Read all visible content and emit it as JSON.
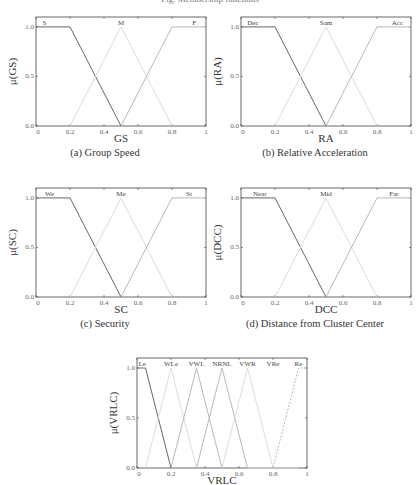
{
  "page": {
    "top_caption": "Fig. Membership functions"
  },
  "colors": {
    "axis": "#444444",
    "dark": "#555555",
    "mid": "#b0b0b0",
    "light": "#d8d8d8"
  },
  "chart_data": [
    {
      "id": "a",
      "type": "line",
      "caption": "(a) Group Speed",
      "xlabel": "GS",
      "ylabel": "μ(GS)",
      "xlim": [
        0,
        1
      ],
      "ylim": [
        0,
        1.1
      ],
      "xticks": [
        "0",
        "0.2",
        "0.4",
        "0.6",
        "0.8",
        "1"
      ],
      "yticks": [
        "0.0",
        "0.5",
        "1.0"
      ],
      "series": [
        {
          "name": "S",
          "points": [
            [
              0,
              1
            ],
            [
              0.2,
              1
            ],
            [
              0.5,
              0
            ]
          ],
          "style": "dark"
        },
        {
          "name": "M",
          "points": [
            [
              0.2,
              0
            ],
            [
              0.5,
              1
            ],
            [
              0.8,
              0
            ]
          ],
          "style": "light"
        },
        {
          "name": "F",
          "points": [
            [
              0.5,
              0
            ],
            [
              0.8,
              1
            ],
            [
              1,
              1
            ]
          ],
          "style": "mid"
        }
      ],
      "labels": [
        {
          "text": "S",
          "x": 0.05
        },
        {
          "text": "M",
          "x": 0.5
        },
        {
          "text": "F",
          "x": 0.93
        }
      ]
    },
    {
      "id": "b",
      "type": "line",
      "caption": "(b) Relative Acceleration",
      "xlabel": "RA",
      "ylabel": "μ(RA)",
      "xlim": [
        0,
        1
      ],
      "ylim": [
        0,
        1.1
      ],
      "xticks": [
        "0",
        "0.2",
        "0.4",
        "0.6",
        "0.8",
        "1"
      ],
      "yticks": [
        "0.0",
        "0.5",
        "1.0"
      ],
      "series": [
        {
          "name": "Dec",
          "points": [
            [
              0,
              1
            ],
            [
              0.2,
              1
            ],
            [
              0.5,
              0
            ]
          ],
          "style": "dark"
        },
        {
          "name": "Sam",
          "points": [
            [
              0.2,
              0
            ],
            [
              0.5,
              1
            ],
            [
              0.8,
              0
            ]
          ],
          "style": "light"
        },
        {
          "name": "Acc",
          "points": [
            [
              0.5,
              0
            ],
            [
              0.8,
              1
            ],
            [
              1,
              1
            ]
          ],
          "style": "mid"
        }
      ],
      "labels": [
        {
          "text": "Dec",
          "x": 0.07
        },
        {
          "text": "Sam",
          "x": 0.5
        },
        {
          "text": "Acc",
          "x": 0.92
        }
      ]
    },
    {
      "id": "c",
      "type": "line",
      "caption": "(c) Security",
      "xlabel": "SC",
      "ylabel": "μ(SC)",
      "xlim": [
        0,
        1
      ],
      "ylim": [
        0,
        1.1
      ],
      "xticks": [
        "0",
        "0.2",
        "0.4",
        "0.6",
        "0.8",
        "1"
      ],
      "yticks": [
        "0.0",
        "0.5",
        "1.0"
      ],
      "series": [
        {
          "name": "We",
          "points": [
            [
              0,
              1
            ],
            [
              0.2,
              1
            ],
            [
              0.5,
              0
            ]
          ],
          "style": "dark"
        },
        {
          "name": "Me",
          "points": [
            [
              0.2,
              0
            ],
            [
              0.5,
              1
            ],
            [
              0.8,
              0
            ]
          ],
          "style": "light"
        },
        {
          "name": "St",
          "points": [
            [
              0.5,
              0
            ],
            [
              0.8,
              1
            ],
            [
              1,
              1
            ]
          ],
          "style": "mid"
        }
      ],
      "labels": [
        {
          "text": "We",
          "x": 0.08
        },
        {
          "text": "Me",
          "x": 0.5
        },
        {
          "text": "St",
          "x": 0.9
        }
      ]
    },
    {
      "id": "d",
      "type": "line",
      "caption": "(d) Distance from Cluster Center",
      "xlabel": "DCC",
      "ylabel": "μ(DCC)",
      "xlim": [
        0,
        1
      ],
      "ylim": [
        0,
        1.1
      ],
      "xticks": [
        "0",
        "0.2",
        "0.4",
        "0.6",
        "0.8",
        "1"
      ],
      "yticks": [
        "0.0",
        "0.5",
        "1.0"
      ],
      "series": [
        {
          "name": "Near",
          "points": [
            [
              0,
              1
            ],
            [
              0.2,
              1
            ],
            [
              0.5,
              0
            ]
          ],
          "style": "dark"
        },
        {
          "name": "Mid",
          "points": [
            [
              0.2,
              0
            ],
            [
              0.5,
              1
            ],
            [
              0.8,
              0
            ]
          ],
          "style": "light"
        },
        {
          "name": "Far",
          "points": [
            [
              0.5,
              0
            ],
            [
              0.8,
              1
            ],
            [
              1,
              1
            ]
          ],
          "style": "mid"
        }
      ],
      "labels": [
        {
          "text": "Near",
          "x": 0.11
        },
        {
          "text": "Mid",
          "x": 0.5
        },
        {
          "text": "Far",
          "x": 0.9
        }
      ]
    },
    {
      "id": "e",
      "type": "line",
      "caption": "",
      "xlabel": "VRLC",
      "ylabel": "μ(VRLC)",
      "xlim": [
        0,
        1
      ],
      "ylim": [
        0,
        1.1
      ],
      "xticks": [
        "0",
        "0.2",
        "0.4",
        "0.6",
        "0.8",
        "1"
      ],
      "yticks": [
        "0.0",
        "0.5",
        "1.0"
      ],
      "series": [
        {
          "name": "Le",
          "points": [
            [
              0,
              1
            ],
            [
              0.05,
              1
            ],
            [
              0.2,
              0
            ]
          ],
          "style": "dark"
        },
        {
          "name": "WLe",
          "points": [
            [
              0.05,
              0
            ],
            [
              0.2,
              1
            ],
            [
              0.35,
              0
            ]
          ],
          "style": "light"
        },
        {
          "name": "VWL",
          "points": [
            [
              0.2,
              0
            ],
            [
              0.35,
              1
            ],
            [
              0.5,
              0
            ]
          ],
          "style": "mid"
        },
        {
          "name": "NRNL",
          "points": [
            [
              0.35,
              0
            ],
            [
              0.5,
              1
            ],
            [
              0.65,
              0
            ]
          ],
          "style": "mid"
        },
        {
          "name": "VWR",
          "points": [
            [
              0.5,
              0
            ],
            [
              0.65,
              1
            ],
            [
              0.8,
              0
            ]
          ],
          "style": "light"
        },
        {
          "name": "VRe",
          "points": [
            [
              0.65,
              0
            ],
            [
              0.8,
              0
            ],
            [
              0.95,
              0
            ]
          ],
          "style": "light"
        },
        {
          "name": "Re",
          "points": [
            [
              0.8,
              0
            ],
            [
              0.95,
              1
            ],
            [
              1,
              1
            ]
          ],
          "style": "dashed"
        }
      ],
      "labels": [
        {
          "text": "Le",
          "x": 0.03
        },
        {
          "text": "WLe",
          "x": 0.2
        },
        {
          "text": "VWL",
          "x": 0.35
        },
        {
          "text": "NRNL",
          "x": 0.5
        },
        {
          "text": "VWR",
          "x": 0.65
        },
        {
          "text": "VRe",
          "x": 0.8
        },
        {
          "text": "Re",
          "x": 0.95
        }
      ]
    }
  ],
  "layout": [
    {
      "left": 36,
      "top": 17,
      "w": 170,
      "h": 109,
      "cap_x": 0,
      "cap_w": 210,
      "cap_y": 147
    },
    {
      "left": 241,
      "top": 17,
      "w": 170,
      "h": 109,
      "cap_x": 210,
      "cap_w": 210,
      "cap_y": 147
    },
    {
      "left": 36,
      "top": 188,
      "w": 170,
      "h": 109,
      "cap_x": 0,
      "cap_w": 210,
      "cap_y": 318
    },
    {
      "left": 241,
      "top": 188,
      "w": 170,
      "h": 109,
      "cap_x": 210,
      "cap_w": 210,
      "cap_y": 318
    },
    {
      "left": 137,
      "top": 358,
      "w": 170,
      "h": 110,
      "cap_x": 0,
      "cap_w": 0,
      "cap_y": 0
    }
  ]
}
